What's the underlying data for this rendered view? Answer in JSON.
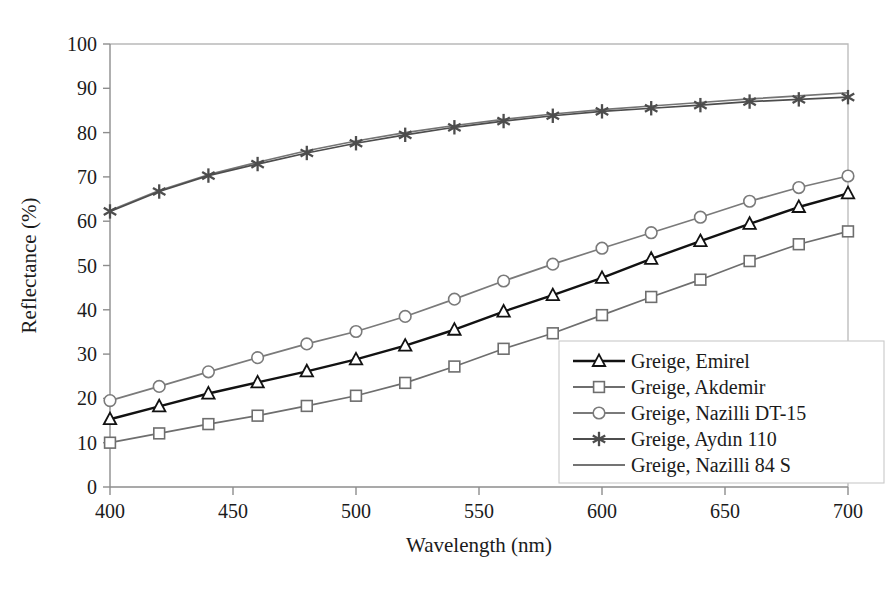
{
  "chart_data": {
    "type": "line",
    "title": "",
    "xlabel": "Wavelength (nm)",
    "ylabel": "Reflectance (%)",
    "xlim": [
      400,
      700
    ],
    "ylim": [
      0,
      100
    ],
    "xticks": [
      400,
      450,
      500,
      550,
      600,
      650,
      700
    ],
    "yticks": [
      0,
      10,
      20,
      30,
      40,
      50,
      60,
      70,
      80,
      90,
      100
    ],
    "grid": false,
    "legend_position": "inside-bottom-right",
    "x": [
      400,
      420,
      440,
      460,
      480,
      500,
      520,
      540,
      560,
      580,
      600,
      620,
      640,
      660,
      680,
      700
    ],
    "series": [
      {
        "name": "Greige, Emirel",
        "marker": "triangle",
        "color": "#121212",
        "values": [
          15.3,
          18.2,
          21.1,
          23.6,
          26.1,
          28.8,
          31.9,
          35.5,
          39.6,
          43.3,
          47.2,
          51.5,
          55.5,
          59.4,
          63.2,
          66.3
        ]
      },
      {
        "name": "Greige, Akdemir",
        "marker": "square",
        "color": "#6e6e6e",
        "values": [
          10.0,
          12.1,
          14.2,
          16.1,
          18.3,
          20.6,
          23.5,
          27.2,
          31.2,
          34.7,
          38.8,
          42.9,
          46.8,
          51.0,
          54.8,
          57.7
        ]
      },
      {
        "name": "Greige, Nazilli DT-15",
        "marker": "circle",
        "color": "#7a7a7a",
        "values": [
          19.5,
          22.7,
          26.0,
          29.2,
          32.3,
          35.1,
          38.5,
          42.4,
          46.5,
          50.3,
          53.9,
          57.4,
          60.9,
          64.5,
          67.6,
          70.2
        ]
      },
      {
        "name": "Greige, Aydın 110",
        "marker": "asterisk",
        "color": "#4d4d4d",
        "values": [
          62.2,
          66.7,
          70.3,
          72.9,
          75.4,
          77.6,
          79.5,
          81.2,
          82.6,
          83.8,
          84.8,
          85.5,
          86.2,
          87.0,
          87.5,
          88.0
        ]
      },
      {
        "name": "Greige, Nazilli 84 S",
        "marker": "none",
        "color": "#747474",
        "values": [
          62.4,
          66.9,
          70.5,
          73.3,
          75.9,
          78.1,
          80.0,
          81.6,
          83.0,
          84.2,
          85.2,
          86.0,
          86.8,
          87.6,
          88.3,
          89.0
        ]
      }
    ]
  }
}
